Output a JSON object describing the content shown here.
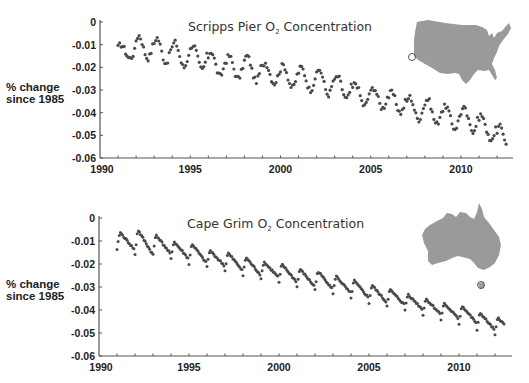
{
  "chart_data": [
    {
      "type": "scatter",
      "title": "Scripps Pier O₂ Concentration",
      "title_main": "Scripps Pier O",
      "title_sub": "2",
      "title_rest": " Concentration",
      "xlabel": "",
      "ylabel": "% change since 1985",
      "ylabel_lines": [
        "% change",
        "since 1985"
      ],
      "xlim": [
        1990,
        2013
      ],
      "ylim": [
        -0.06,
        0
      ],
      "x_ticks": [
        1990,
        1995,
        2000,
        2005,
        2010
      ],
      "x_tick_labels": [
        "1990",
        "1995",
        "2000",
        "2005",
        "2010"
      ],
      "y_ticks": [
        0,
        -0.01,
        -0.02,
        -0.03,
        -0.04,
        -0.05,
        -0.06
      ],
      "y_tick_labels": [
        "0",
        "-0.01",
        "-0.02",
        "-0.03",
        "-0.04",
        "-0.05",
        "-0.06"
      ],
      "grid": false,
      "legend": "none",
      "inset_map": "United States (Scripps Pier, La Jolla, CA marked)",
      "series": [
        {
          "name": "Scripps Pier O2",
          "x_start": 1991.0,
          "x_end": 2012.5,
          "samples_per_year": 12,
          "trend_start": -0.0115,
          "trend_end": -0.0505,
          "seasonal_amplitude": 0.0045,
          "annual_peaks": {
            "1991": -0.01,
            "1992": -0.006,
            "1993": -0.007,
            "1994": -0.009,
            "1995": -0.01,
            "1996": -0.013,
            "1997": -0.015,
            "1998": -0.015,
            "1999": -0.018,
            "2000": -0.019,
            "2001": -0.02,
            "2002": -0.021,
            "2003": -0.024,
            "2004": -0.027,
            "2005": -0.029,
            "2006": -0.031,
            "2007": -0.033,
            "2008": -0.034,
            "2009": -0.037,
            "2010": -0.038,
            "2011": -0.041,
            "2012": -0.046
          },
          "annual_troughs": {
            "1991": -0.016,
            "1992": -0.016,
            "1993": -0.018,
            "1994": -0.02,
            "1995": -0.021,
            "1996": -0.024,
            "1997": -0.025,
            "1998": -0.026,
            "1999": -0.027,
            "2000": -0.029,
            "2001": -0.03,
            "2002": -0.032,
            "2003": -0.034,
            "2004": -0.037,
            "2005": -0.038,
            "2006": -0.04,
            "2007": -0.043,
            "2008": -0.045,
            "2009": -0.047,
            "2010": -0.048,
            "2011": -0.053,
            "2012": -0.056
          }
        }
      ]
    },
    {
      "type": "scatter",
      "title": "Cape Grim O₂ Concentration",
      "title_main": "Cape Grim O",
      "title_sub": "2",
      "title_rest": " Concentration",
      "xlabel": "",
      "ylabel": "% change since 1985",
      "ylabel_lines": [
        "% change",
        "since 1985"
      ],
      "xlim": [
        1990,
        2013
      ],
      "ylim": [
        -0.06,
        0
      ],
      "x_ticks": [
        1990,
        1995,
        2000,
        2005,
        2010
      ],
      "x_tick_labels": [
        "1990",
        "1995",
        "2000",
        "2005",
        "2010"
      ],
      "y_ticks": [
        0,
        -0.01,
        -0.02,
        -0.03,
        -0.04,
        -0.05,
        -0.06
      ],
      "y_tick_labels": [
        "0",
        "-0.01",
        "-0.02",
        "-0.03",
        "-0.04",
        "-0.05",
        "-0.06"
      ],
      "grid": false,
      "legend": "none",
      "inset_map": "Australia (Cape Grim, Tasmania marked)",
      "series": [
        {
          "name": "Cape Grim O2",
          "x_start": 1991.0,
          "x_end": 2012.5,
          "samples_per_year": 16,
          "trend_start": -0.0095,
          "trend_end": -0.0465,
          "seasonal_amplitude": 0.0042,
          "annual_peaks": {
            "1991": -0.006,
            "1992": -0.005,
            "1993": -0.007,
            "1994": -0.01,
            "1995": -0.011,
            "1996": -0.014,
            "1997": -0.015,
            "1998": -0.017,
            "1999": -0.019,
            "2000": -0.02,
            "2001": -0.022,
            "2002": -0.023,
            "2003": -0.025,
            "2004": -0.027,
            "2005": -0.029,
            "2006": -0.031,
            "2007": -0.033,
            "2008": -0.035,
            "2009": -0.037,
            "2010": -0.038,
            "2011": -0.041,
            "2012": -0.043
          },
          "annual_troughs": {
            "1991": -0.014,
            "1992": -0.016,
            "1993": -0.016,
            "1994": -0.018,
            "1995": -0.02,
            "1996": -0.021,
            "1997": -0.023,
            "1998": -0.025,
            "1999": -0.026,
            "2000": -0.028,
            "2001": -0.03,
            "2002": -0.031,
            "2003": -0.033,
            "2004": -0.035,
            "2005": -0.037,
            "2006": -0.038,
            "2007": -0.04,
            "2008": -0.042,
            "2009": -0.044,
            "2010": -0.046,
            "2011": -0.049,
            "2012": -0.051
          }
        }
      ]
    }
  ],
  "colors": {
    "marker": "#4a4a4a",
    "axis": "#555555",
    "map_fill": "#9a9a9a",
    "text": "#222222"
  }
}
